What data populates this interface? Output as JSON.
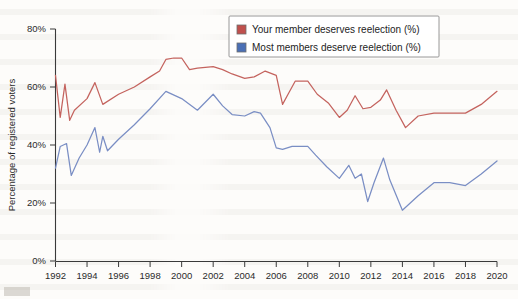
{
  "chart_data": {
    "type": "line",
    "title": "",
    "xlabel": "",
    "ylabel": "Percentage of registered voters",
    "xlim": [
      1992,
      2020
    ],
    "ylim": [
      0,
      80
    ],
    "y_ticks": [
      "0%",
      "20%",
      "40%",
      "60%",
      "80%"
    ],
    "y_tick_values": [
      0,
      20,
      40,
      60,
      80
    ],
    "x_ticks": [
      "1992",
      "1994",
      "1996",
      "1998",
      "2000",
      "2002",
      "2004",
      "2006",
      "2008",
      "2010",
      "2012",
      "2014",
      "2016",
      "2018",
      "2020"
    ],
    "x_tick_values": [
      1992,
      1994,
      1996,
      1998,
      2000,
      2002,
      2004,
      2006,
      2008,
      2010,
      2012,
      2014,
      2016,
      2018,
      2020
    ],
    "grid": false,
    "legend_position": "top-right",
    "series": [
      {
        "name": "Your member deserves reelection (%)",
        "color": "#c4635e",
        "swatch_color": "#c0504d",
        "x": [
          1992.0,
          1992.3,
          1992.6,
          1992.9,
          1993.2,
          1994.0,
          1994.5,
          1995.0,
          1996.0,
          1997.0,
          1998.0,
          1998.6,
          1999.0,
          1999.5,
          2000.0,
          2000.5,
          2001.0,
          2002.0,
          2002.6,
          2003.2,
          2004.0,
          2004.6,
          2005.3,
          2006.0,
          2006.4,
          2006.8,
          2007.2,
          2008.0,
          2008.6,
          2009.3,
          2010.0,
          2010.5,
          2011.0,
          2011.5,
          2012.0,
          2012.6,
          2013.0,
          2013.6,
          2014.2,
          2015.0,
          2016.0,
          2017.0,
          2018.0,
          2019.0,
          2020.0
        ],
        "y": [
          64.0,
          49.5,
          61.0,
          48.5,
          52.0,
          56.0,
          61.5,
          54.0,
          57.5,
          60.0,
          63.5,
          65.5,
          69.5,
          70.0,
          70.0,
          66.0,
          66.5,
          67.0,
          66.0,
          64.5,
          63.0,
          63.5,
          65.5,
          64.0,
          54.0,
          58.0,
          62.0,
          62.0,
          57.5,
          54.5,
          49.5,
          52.0,
          57.0,
          52.5,
          53.0,
          55.5,
          59.0,
          52.0,
          46.0,
          50.0,
          51.0,
          51.0,
          51.0,
          54.0,
          58.5
        ]
      },
      {
        "name": "Most members deserve reelection (%)",
        "color": "#7a8ec4",
        "swatch_color": "#4a6fb5",
        "x": [
          1992.0,
          1992.3,
          1992.7,
          1993.0,
          1993.5,
          1994.0,
          1994.5,
          1994.8,
          1995.0,
          1995.3,
          1996.0,
          1997.0,
          1998.0,
          1999.0,
          2000.0,
          2001.0,
          2002.0,
          2002.6,
          2003.2,
          2004.0,
          2004.6,
          2005.0,
          2005.6,
          2006.0,
          2006.4,
          2007.0,
          2008.0,
          2008.5,
          2009.2,
          2010.0,
          2010.6,
          2011.0,
          2011.4,
          2011.8,
          2012.2,
          2012.8,
          2013.2,
          2014.0,
          2015.0,
          2016.0,
          2017.0,
          2018.0,
          2019.0,
          2020.0
        ],
        "y": [
          32.0,
          39.5,
          40.5,
          29.5,
          35.5,
          40.0,
          46.0,
          37.5,
          43.0,
          38.0,
          42.0,
          47.0,
          52.5,
          58.5,
          56.0,
          52.0,
          57.5,
          53.5,
          50.5,
          50.0,
          51.5,
          51.0,
          46.0,
          39.0,
          38.5,
          39.5,
          39.5,
          36.5,
          32.5,
          28.5,
          33.0,
          28.5,
          30.0,
          20.5,
          27.0,
          35.5,
          28.0,
          17.5,
          22.5,
          27.0,
          27.0,
          26.0,
          30.0,
          34.5
        ]
      }
    ]
  },
  "legend": {
    "entries": [
      {
        "label": "Your member deserves reelection (%)",
        "color": "#c0504d"
      },
      {
        "label": "Most members deserve reelection (%)",
        "color": "#4a6fb5"
      }
    ]
  }
}
